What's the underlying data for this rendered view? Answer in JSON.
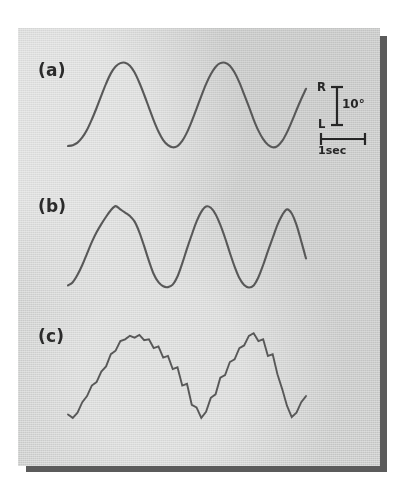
{
  "figure": {
    "background_color": "#dddedd",
    "page_color": "#ffffff",
    "shadow_color": "#5b5b5b",
    "trace_color": "#585858",
    "panels": [
      {
        "id": "a",
        "label": "(a)"
      },
      {
        "id": "b",
        "label": "(b)"
      },
      {
        "id": "c",
        "label": "(c)"
      }
    ]
  },
  "scale_bar": {
    "up_label": "R",
    "down_label": "L",
    "amplitude_label": "10°",
    "time_label": "1sec"
  },
  "chart_data": {
    "type": "line",
    "title": "",
    "xlabel": "",
    "ylabel": "",
    "grid": false,
    "legend": "none",
    "axis_note": "no drawn axes; calibration bars only",
    "calibration": {
      "vertical": {
        "value": 10,
        "unit": "degrees",
        "positive_direction": "R",
        "negative_direction": "L"
      },
      "horizontal": {
        "value": 1,
        "unit": "sec"
      }
    },
    "series": [
      {
        "name": "(a)",
        "description": "smooth sinusoidal horizontal eye position, approximately 3 cycles, no saccadic steps",
        "cycles": 3,
        "x": [
          0,
          2,
          4,
          6,
          8,
          10,
          12,
          14,
          16,
          18,
          20,
          22,
          24,
          26,
          28,
          30,
          32,
          34,
          36,
          38,
          40,
          42,
          44,
          46,
          48,
          50,
          52,
          54,
          56,
          58,
          60,
          62,
          64,
          66,
          68,
          70,
          72,
          74,
          76,
          78,
          80,
          82,
          84,
          86,
          88,
          90,
          92,
          94,
          96,
          98,
          100
        ],
        "y": [
          -9.6,
          -9.4,
          -8.8,
          -7.6,
          -5.8,
          -3.4,
          -0.7,
          2.2,
          5.0,
          7.4,
          9.0,
          9.8,
          9.9,
          9.2,
          7.6,
          5.2,
          2.4,
          -0.6,
          -3.6,
          -6.2,
          -8.2,
          -9.4,
          -9.9,
          -9.6,
          -8.4,
          -6.4,
          -3.8,
          -0.9,
          2.1,
          4.9,
          7.2,
          8.9,
          9.8,
          9.9,
          9.2,
          7.6,
          5.3,
          2.5,
          -0.4,
          -3.4,
          -6.0,
          -8.0,
          -9.3,
          -9.9,
          -9.6,
          -8.4,
          -6.4,
          -3.9,
          -1.2,
          1.4,
          3.8
        ]
      },
      {
        "name": "(b)",
        "description": "near-sinusoidal but with slightly peaked, asymmetric crests and flattened troughs",
        "cycles": 3,
        "x": [
          0,
          2,
          4,
          6,
          8,
          10,
          12,
          14,
          16,
          18,
          20,
          22,
          24,
          26,
          28,
          30,
          32,
          34,
          36,
          38,
          40,
          42,
          44,
          46,
          48,
          50,
          52,
          54,
          56,
          58,
          60,
          62,
          64,
          66,
          68,
          70,
          72,
          74,
          76,
          78,
          80,
          82,
          84,
          86,
          88,
          90,
          92,
          94,
          96,
          98,
          100
        ],
        "y": [
          -9.4,
          -8.6,
          -6.8,
          -4.4,
          -1.6,
          1.2,
          3.6,
          5.6,
          7.4,
          9.0,
          10.0,
          9.2,
          8.4,
          7.6,
          6.2,
          3.6,
          0.2,
          -3.4,
          -6.6,
          -8.6,
          -9.6,
          -9.8,
          -9.2,
          -7.2,
          -4.0,
          -0.4,
          3.0,
          6.2,
          8.6,
          9.9,
          9.6,
          8.0,
          5.4,
          2.2,
          -1.4,
          -4.8,
          -7.6,
          -9.3,
          -9.9,
          -9.4,
          -7.4,
          -4.4,
          -1.0,
          2.2,
          5.4,
          7.8,
          9.2,
          8.2,
          5.4,
          1.4,
          -2.8
        ]
      },
      {
        "name": "(c)",
        "description": "saccadic / cogwheel pursuit: staircase-like stepped trace superimposed on the slow-phase waveform",
        "cycles": 3,
        "x": [
          0,
          2,
          4,
          6,
          8,
          10,
          12,
          14,
          16,
          18,
          20,
          22,
          24,
          26,
          28,
          30,
          32,
          34,
          36,
          38,
          40,
          42,
          44,
          46,
          48,
          50,
          52,
          54,
          56,
          58,
          60,
          62,
          64,
          66,
          68,
          70,
          72,
          74,
          76,
          78,
          80,
          82,
          84,
          86,
          88,
          90,
          92,
          94,
          96,
          98,
          100
        ],
        "y": [
          -8.8,
          -9.6,
          -8.4,
          -6.0,
          -4.6,
          -2.2,
          -1.4,
          1.0,
          2.2,
          5.0,
          5.8,
          8.0,
          8.4,
          9.2,
          8.8,
          9.4,
          8.2,
          8.4,
          6.4,
          6.8,
          4.2,
          4.6,
          1.6,
          2.0,
          -2.2,
          -1.8,
          -6.6,
          -7.2,
          -9.6,
          -8.2,
          -5.0,
          -4.2,
          -0.4,
          0.2,
          3.2,
          3.8,
          6.4,
          7.0,
          9.2,
          9.8,
          8.0,
          8.4,
          4.6,
          5.0,
          0.4,
          -3.0,
          -6.8,
          -9.4,
          -8.4,
          -6.0,
          -4.6
        ]
      }
    ]
  }
}
